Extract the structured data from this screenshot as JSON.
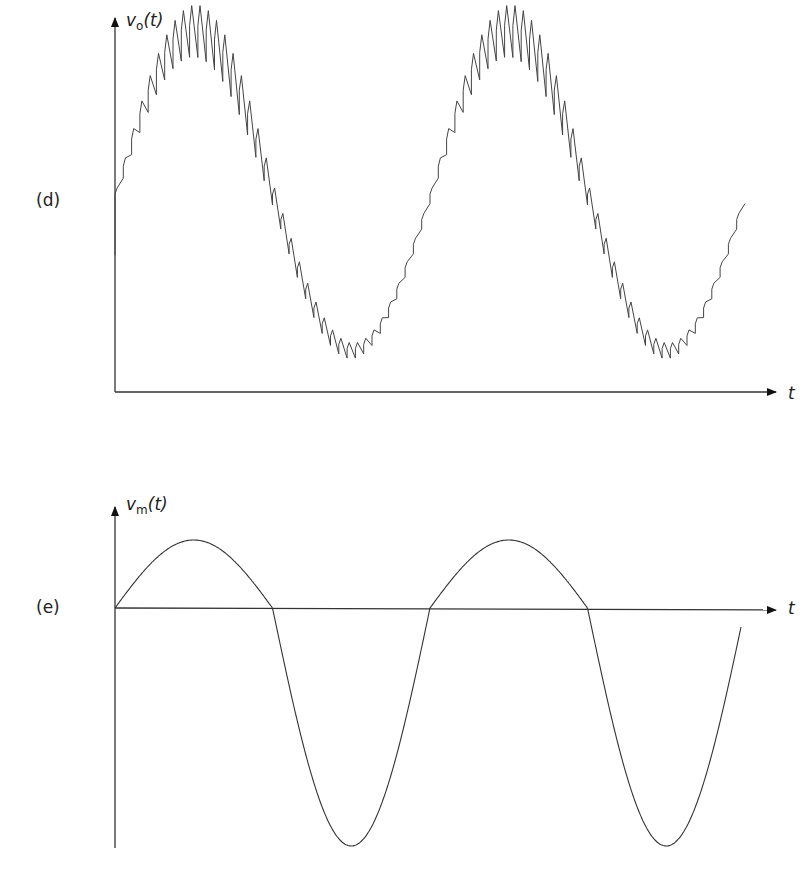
{
  "panels": [
    {
      "id": "d",
      "label": "(d)",
      "y_axis_label_var": "v",
      "y_axis_label_sub": "o",
      "y_axis_label_arg": "(t)",
      "x_axis_label": "t",
      "description": "Ripple-modulated sinusoid (sawtooth carrier superimposed on sine)"
    },
    {
      "id": "e",
      "label": "(e)",
      "y_axis_label_var": "v",
      "y_axis_label_sub": "m",
      "y_axis_label_arg": "(t)",
      "x_axis_label": "t",
      "description": "Pure sinusoid, ~2 periods"
    }
  ],
  "chart_data": [
    {
      "type": "line",
      "title": "(d)",
      "xlabel": "t",
      "ylabel": "v_o(t)",
      "series": [
        {
          "name": "v_o(t)",
          "shape": "sine with sawtooth ripple",
          "periods": 1.9,
          "offset": "positive, above zero",
          "ripple_teeth_per_period": 38
        }
      ],
      "grid": false
    },
    {
      "type": "line",
      "title": "(e)",
      "xlabel": "t",
      "ylabel": "v_m(t)",
      "series": [
        {
          "name": "v_m(t)",
          "shape": "sine",
          "periods": 2,
          "offset": 0
        }
      ],
      "grid": false
    }
  ]
}
